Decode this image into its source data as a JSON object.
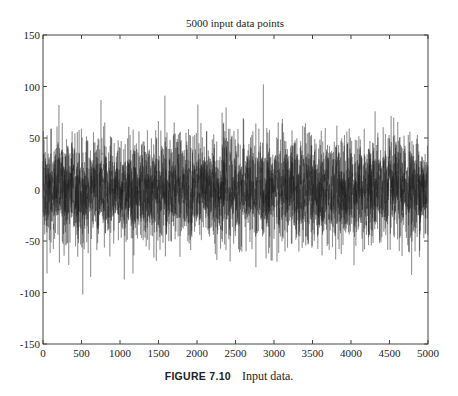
{
  "chart_data": {
    "type": "line",
    "title": "5000 input data points",
    "xlabel": "",
    "ylabel": "",
    "xlim": [
      0,
      5000
    ],
    "ylim": [
      -150,
      150
    ],
    "xticks": [
      0,
      500,
      1000,
      1500,
      2000,
      2500,
      3000,
      3500,
      4000,
      4500,
      5000
    ],
    "yticks": [
      -150,
      -100,
      -50,
      0,
      50,
      100,
      150
    ],
    "grid": false,
    "legend": null,
    "series": [
      {
        "name": "input data",
        "n_points": 5000,
        "description": "zero-mean random noise signal",
        "mean": 0,
        "approx_std": 25,
        "approx_max": 102,
        "approx_min": -102,
        "color": "#1a1a1a"
      }
    ]
  },
  "caption": {
    "figure_label": "FIGURE 7.10",
    "text": "Input data."
  }
}
